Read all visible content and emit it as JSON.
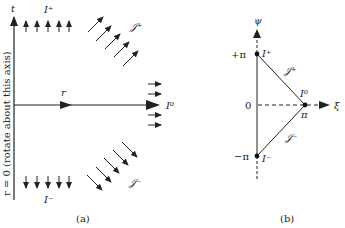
{
  "panel_a": {
    "caption": "(a)",
    "axis_t_label": "t",
    "axis_r0_label": "r = 0 (rotate about this axis)",
    "radial_label": "r",
    "future_timelike_label": "I⁺",
    "past_timelike_label": "I⁻",
    "spatial_infinity_label": "I⁰",
    "future_null_label": "𝒥⁺",
    "past_null_label": "𝒥⁻"
  },
  "panel_b": {
    "caption": "(b)",
    "vertical_axis_label": "ψ",
    "horizontal_axis_label": "ξ",
    "tick_plus_pi": "+π",
    "tick_zero": "0",
    "tick_minus_pi": "−π",
    "point_i_plus": "I⁺",
    "point_i_zero": "I⁰",
    "point_i_minus": "I⁻",
    "pi_label": "π",
    "scri_plus": "𝒥⁺",
    "scri_minus": "𝒥⁻"
  },
  "colors": {
    "ink": "#222222",
    "background": "#ffffff"
  }
}
